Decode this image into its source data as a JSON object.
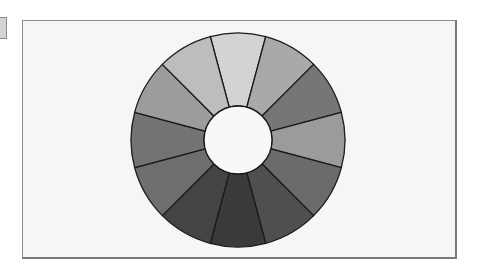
{
  "figure": {
    "type": "color-wheel",
    "center": [
      238,
      140
    ],
    "outer_radius": 107,
    "inner_radius": 34,
    "segment_count": 12,
    "start_angle_deg": -15,
    "outline_color": "#1a1a1a",
    "center_color": "#f8f8f8",
    "segments": [
      {
        "index": 0,
        "angle_deg": 0,
        "color": "#d3d3d3"
      },
      {
        "index": 1,
        "angle_deg": 30,
        "color": "#a9a9a9"
      },
      {
        "index": 2,
        "angle_deg": 60,
        "color": "#767676"
      },
      {
        "index": 3,
        "angle_deg": 90,
        "color": "#9b9b9b"
      },
      {
        "index": 4,
        "angle_deg": 120,
        "color": "#6b6b6b"
      },
      {
        "index": 5,
        "angle_deg": 150,
        "color": "#4f4f4f"
      },
      {
        "index": 6,
        "angle_deg": 180,
        "color": "#3a3a3a"
      },
      {
        "index": 7,
        "angle_deg": 210,
        "color": "#444444"
      },
      {
        "index": 8,
        "angle_deg": 240,
        "color": "#6e6e6e"
      },
      {
        "index": 9,
        "angle_deg": 270,
        "color": "#737373"
      },
      {
        "index": 10,
        "angle_deg": 300,
        "color": "#9c9c9c"
      },
      {
        "index": 11,
        "angle_deg": 330,
        "color": "#bdbdbd"
      }
    ]
  },
  "frame": {
    "background": "#f6f6f6",
    "border_color": "#8c8c8c"
  }
}
